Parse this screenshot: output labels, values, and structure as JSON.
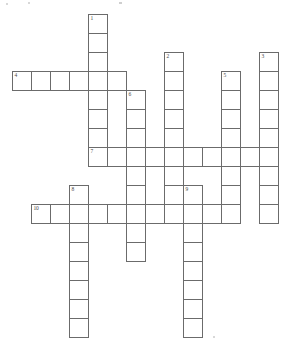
{
  "puzzle": {
    "type": "crossword-grid",
    "title": "",
    "grid": {
      "cell_size_px": 19,
      "origin_x_px": 12,
      "origin_y_px": 14,
      "columns": 14,
      "rows": 17,
      "border_color": "#6b6b6b",
      "cell_fill": "#ffffff",
      "number_color": "#4a4a4a",
      "background": "#ffffff"
    },
    "entries": [
      {
        "number": "1",
        "direction": "down",
        "col": 4,
        "row": 0,
        "length": 8,
        "answer": ""
      },
      {
        "number": "2",
        "direction": "down",
        "col": 8,
        "row": 2,
        "length": 8,
        "answer": ""
      },
      {
        "number": "3",
        "direction": "down",
        "col": 13,
        "row": 2,
        "length": 9,
        "answer": ""
      },
      {
        "number": "4",
        "direction": "across",
        "col": 0,
        "row": 3,
        "length": 6,
        "answer": ""
      },
      {
        "number": "5",
        "direction": "down",
        "col": 11,
        "row": 3,
        "length": 8,
        "answer": ""
      },
      {
        "number": "6",
        "direction": "down",
        "col": 6,
        "row": 4,
        "length": 9,
        "answer": ""
      },
      {
        "number": "7",
        "direction": "across",
        "col": 4,
        "row": 7,
        "length": 10,
        "answer": ""
      },
      {
        "number": "8",
        "direction": "down",
        "col": 3,
        "row": 9,
        "length": 8,
        "answer": ""
      },
      {
        "number": "9",
        "direction": "down",
        "col": 9,
        "row": 9,
        "length": 8,
        "answer": ""
      },
      {
        "number": "10",
        "direction": "across",
        "col": 1,
        "row": 10,
        "length": 10,
        "answer": ""
      }
    ],
    "numbered_labels": [
      "1",
      "2",
      "3",
      "4",
      "5",
      "6",
      "7",
      "8",
      "9",
      "10"
    ]
  }
}
